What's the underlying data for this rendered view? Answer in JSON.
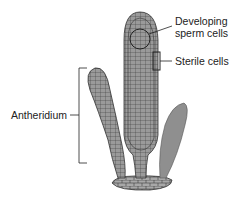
{
  "diagram": {
    "labels": {
      "developing_sperm": "Developing sperm cells",
      "developing_sperm_line1": "Developing",
      "developing_sperm_line2": "sperm cells",
      "sterile": "Sterile cells",
      "antheridium": "Antheridium"
    },
    "colors": {
      "cell_fill": "#9a9a9a",
      "cell_line": "#3a3a3a",
      "paraphysis": "#8f8f8f",
      "label_text": "#222222",
      "leader_line": "#222222"
    }
  }
}
